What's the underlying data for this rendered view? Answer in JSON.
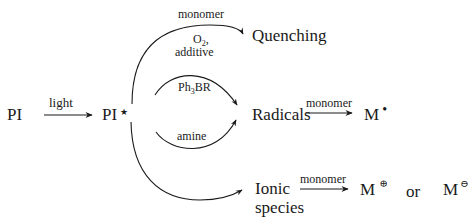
{
  "diagram": {
    "nodes": {
      "pi": "PI",
      "pi_excited": "PI",
      "pi_excited_mark": "★",
      "quenching": "Quenching",
      "radicals": "Radicals",
      "ionic_line1": "Ionic",
      "ionic_line2": "species",
      "m_radical": "M",
      "m_radical_mark": "•",
      "m_cation": "M",
      "m_cation_mark": "⊕",
      "or": "or",
      "m_anion": "M",
      "m_anion_mark": "⊖"
    },
    "edges": {
      "light": "light",
      "quench_top": "monomer",
      "quench_o2": "O",
      "quench_o2_sub": "2",
      "quench_o2_comma": ",",
      "quench_additive": "additive",
      "ph3br": "Ph",
      "ph3br_sub": "3",
      "ph3br_rest": "BR",
      "amine": "amine",
      "radical_monomer": "monomer",
      "ionic_monomer": "monomer"
    }
  }
}
